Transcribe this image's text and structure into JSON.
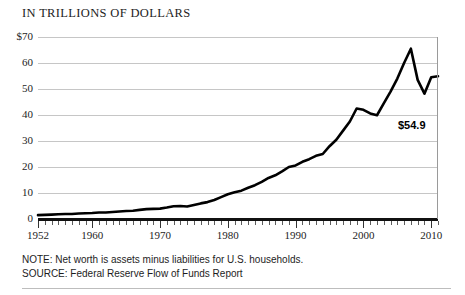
{
  "chart_data": {
    "type": "line",
    "title": "IN TRILLIONS OF DOLLARS",
    "xlabel": "",
    "ylabel": "",
    "grid": true,
    "legend": "none",
    "xlim": [
      1952,
      2011
    ],
    "ylim": [
      0,
      70
    ],
    "ytick_labels": [
      "$70",
      "60",
      "50",
      "40",
      "30",
      "20",
      "10",
      "0"
    ],
    "ytick_values": [
      70,
      60,
      50,
      40,
      30,
      20,
      10,
      0
    ],
    "xtick_labels": [
      "1952",
      "1960",
      "1970",
      "1980",
      "1990",
      "2000",
      "2010"
    ],
    "xtick_values": [
      1952,
      1960,
      1970,
      1980,
      1990,
      2000,
      2010
    ],
    "minor_tick_interval_years": 1,
    "annotations": [
      {
        "text": "$54.9",
        "x": 2011,
        "y": 54.9
      }
    ],
    "series": [
      {
        "name": "Household net worth",
        "color": "#000000",
        "x": [
          1952,
          1953,
          1954,
          1955,
          1956,
          1957,
          1958,
          1959,
          1960,
          1961,
          1962,
          1963,
          1964,
          1965,
          1966,
          1967,
          1968,
          1969,
          1970,
          1971,
          1972,
          1973,
          1974,
          1975,
          1976,
          1977,
          1978,
          1979,
          1980,
          1981,
          1982,
          1983,
          1984,
          1985,
          1986,
          1987,
          1988,
          1989,
          1990,
          1991,
          1992,
          1993,
          1994,
          1995,
          1996,
          1997,
          1998,
          1999,
          2000,
          2001,
          2002,
          2003,
          2004,
          2005,
          2006,
          2007,
          2008,
          2009,
          2010,
          2011
        ],
        "values": [
          1.5,
          1.6,
          1.7,
          1.8,
          1.9,
          1.9,
          2.1,
          2.2,
          2.3,
          2.5,
          2.5,
          2.7,
          2.9,
          3.1,
          3.2,
          3.5,
          3.8,
          3.9,
          4.0,
          4.4,
          4.9,
          5.0,
          4.8,
          5.4,
          6.0,
          6.5,
          7.3,
          8.4,
          9.5,
          10.3,
          10.9,
          12.0,
          13.0,
          14.3,
          15.8,
          16.8,
          18.3,
          20.0,
          20.6,
          22.0,
          23.0,
          24.3,
          25.0,
          28.0,
          30.5,
          34.0,
          37.5,
          42.5,
          42.0,
          40.6,
          39.9,
          44.5,
          49.0,
          54.0,
          60.0,
          65.5,
          53.5,
          48.2,
          54.5,
          54.9
        ]
      }
    ]
  },
  "notes": {
    "note_line": "NOTE: Net worth is assets minus liabilities for U.S. households.",
    "source_line": "SOURCE: Federal Reserve Flow of Funds Report"
  },
  "colors": {
    "series": "#000000",
    "gridline": "#c6c6c6",
    "axis": "#111111",
    "text": "#1d1d1d"
  }
}
